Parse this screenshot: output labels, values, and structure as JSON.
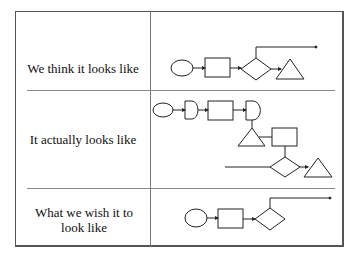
{
  "rows": [
    {
      "label": "We think it looks like"
    },
    {
      "label": "It actually looks like"
    },
    {
      "label": "What we wish it to look like"
    }
  ],
  "colors": {
    "line": "#222222",
    "border": "#555555",
    "background": "#ffffff"
  },
  "diagrams": {
    "row1": [
      "ellipse",
      "rectangle",
      "diamond",
      "triangle",
      "branch-arrow"
    ],
    "row2": [
      "ellipse",
      "delay",
      "rectangle",
      "delay",
      "triangle",
      "rectangle",
      "diamond",
      "triangle",
      "incoming-line"
    ],
    "row3": [
      "ellipse",
      "rectangle",
      "diamond",
      "branch-arrow"
    ]
  }
}
